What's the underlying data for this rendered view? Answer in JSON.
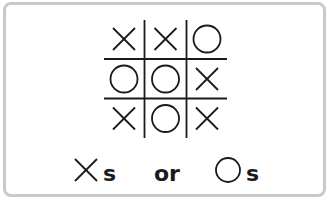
{
  "board": {
    "cells": [
      [
        "X",
        "X",
        "O"
      ],
      [
        "O",
        "O",
        "X"
      ],
      [
        "X",
        "O",
        "X"
      ]
    ]
  },
  "legend": {
    "x_label": "s",
    "separator": "or",
    "o_label": "s"
  },
  "colors": {
    "ink": "#1a1a1a",
    "border": "#c9c9c9",
    "background": "#ffffff"
  }
}
